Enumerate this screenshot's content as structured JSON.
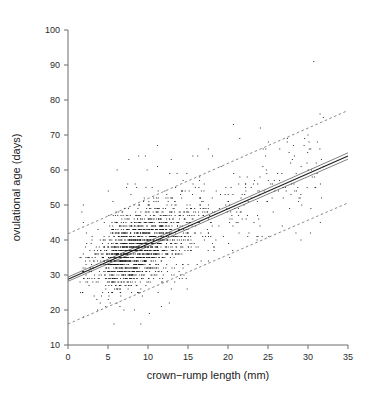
{
  "figure": {
    "background_color": "#ffffff",
    "point_color": "#111111",
    "line_color": "#1e1e1e",
    "axis_color": "#6d6d6d"
  },
  "axes": {
    "x_title": "crown−rump length (mm)",
    "y_title": "ovulational age (days)",
    "x_ticks": [
      "0",
      "5",
      "10",
      "15",
      "20",
      "25",
      "30",
      "35"
    ],
    "y_ticks": [
      "10",
      "20",
      "30",
      "40",
      "50",
      "60",
      "70",
      "80",
      "90",
      "100"
    ]
  },
  "chart_data": {
    "type": "scatter",
    "title": "",
    "xlabel": "crown−rump length (mm)",
    "ylabel": "ovulational age (days)",
    "xlim": [
      0,
      35
    ],
    "ylim": [
      10,
      100
    ],
    "xticks": [
      0,
      5,
      10,
      15,
      20,
      25,
      30,
      35
    ],
    "yticks": [
      10,
      20,
      30,
      40,
      50,
      60,
      70,
      80,
      90,
      100
    ],
    "grid": false,
    "legend": null,
    "annotations": [],
    "series": [
      {
        "name": "observations",
        "type": "scatter",
        "marker": "small-dot",
        "n_points_approx": 1900,
        "x_range": [
          1.3,
          33.0
        ],
        "y_range": [
          14.5,
          91.5
        ],
        "note": "Ages recorded at integer days producing horizontal banding; bulk of mass between 5-20 mm and 28-52 days."
      },
      {
        "name": "regression fit",
        "type": "line",
        "style": "solid",
        "points": [
          [
            0,
            28.8
          ],
          [
            35,
            64.0
          ]
        ],
        "slope": 1.006,
        "intercept": 28.8
      },
      {
        "name": "confidence band upper",
        "type": "line",
        "style": "solid-thin",
        "points": [
          [
            0,
            29.4
          ],
          [
            35,
            64.9
          ]
        ]
      },
      {
        "name": "confidence band lower",
        "type": "line",
        "style": "solid-thin",
        "points": [
          [
            0,
            28.2
          ],
          [
            35,
            63.1
          ]
        ]
      },
      {
        "name": "prediction limit upper",
        "type": "line",
        "style": "dashed",
        "points": [
          [
            0,
            41.8
          ],
          [
            35,
            77.0
          ]
        ]
      },
      {
        "name": "prediction limit lower",
        "type": "line",
        "style": "dashed",
        "points": [
          [
            0,
            16.0
          ],
          [
            35,
            50.6
          ]
        ]
      }
    ]
  }
}
